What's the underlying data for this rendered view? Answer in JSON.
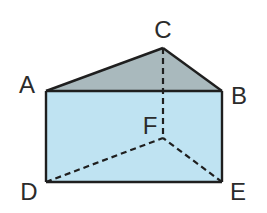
{
  "diagram": {
    "type": "triangular-prism",
    "colors": {
      "top_face": "#a9b9bd",
      "front_face": "#bfe3f2",
      "edge": "#1f1f1f",
      "label": "#2b2b2b",
      "background": "#ffffff"
    },
    "vertices": {
      "A": {
        "label": "A",
        "x": 46,
        "y": 91
      },
      "B": {
        "label": "B",
        "x": 222,
        "y": 91
      },
      "C": {
        "label": "C",
        "x": 163,
        "y": 48
      },
      "D": {
        "label": "D",
        "x": 46,
        "y": 182
      },
      "E": {
        "label": "E",
        "x": 222,
        "y": 182
      },
      "F": {
        "label": "F",
        "x": 163,
        "y": 138
      }
    },
    "solid_edges": [
      "AB",
      "BC",
      "CA",
      "AD",
      "BE",
      "DE"
    ],
    "hidden_edges": [
      "CF",
      "DF",
      "EF"
    ],
    "faces": [
      {
        "name": "top-triangle",
        "vertices": [
          "A",
          "C",
          "B"
        ],
        "fill": "#a9b9bd"
      },
      {
        "name": "front-rectangle",
        "vertices": [
          "A",
          "B",
          "E",
          "D"
        ],
        "fill": "#bfe3f2"
      }
    ]
  }
}
